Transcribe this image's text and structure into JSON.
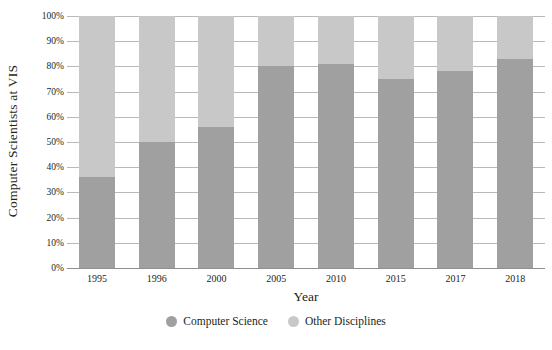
{
  "chart_data": {
    "type": "bar",
    "subtype": "stacked-bar-100-percent",
    "title": "",
    "subtitle": "",
    "xlabel": "Year",
    "ylabel": "Computer Scientists at VIS",
    "categories": [
      "1995",
      "1996",
      "2000",
      "2005",
      "2010",
      "2015",
      "2017",
      "2018"
    ],
    "series": [
      {
        "name": "Computer Science",
        "color": "#a0a0a0",
        "values": [
          36,
          50,
          56,
          80,
          81,
          75,
          78,
          83
        ]
      },
      {
        "name": "Other Disciplines",
        "color": "#c8c8c8",
        "values": [
          64,
          50,
          44,
          20,
          19,
          25,
          22,
          17
        ]
      }
    ],
    "ylim": [
      0,
      100
    ],
    "y_tick_labels": [
      "0%",
      "10%",
      "20%",
      "30%",
      "40%",
      "50%",
      "60%",
      "70%",
      "80%",
      "90%",
      "100%"
    ],
    "y_tick_values": [
      0,
      10,
      20,
      30,
      40,
      50,
      60,
      70,
      80,
      90,
      100
    ],
    "grid": true,
    "grid_axis": "y",
    "legend_position": "bottom",
    "legend": [
      {
        "label": "Computer Science",
        "color": "#a0a0a0",
        "marker": "circle"
      },
      {
        "label": "Other Disciplines",
        "color": "#c8c8c8",
        "marker": "circle"
      }
    ],
    "annotations": []
  },
  "colors": {
    "background": "#ffffff",
    "text": "#231f20",
    "gridline": "#b9b9b9",
    "axis": "#8f8f8f",
    "series_computer_science": "#a0a0a0",
    "series_other_disciplines": "#c8c8c8"
  }
}
